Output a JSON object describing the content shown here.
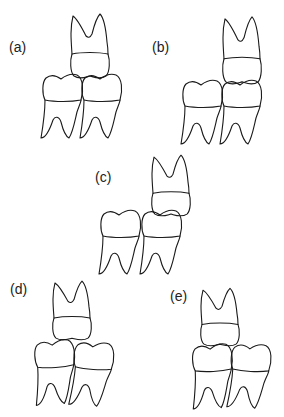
{
  "figure": {
    "panels": [
      {
        "id": "a",
        "label": "(a)"
      },
      {
        "id": "b",
        "label": "(b)"
      },
      {
        "id": "c",
        "label": "(c)"
      },
      {
        "id": "d",
        "label": "(d)"
      },
      {
        "id": "e",
        "label": "(e)"
      }
    ]
  },
  "colors": {
    "line": "#1a1a1a",
    "background": "#ffffff"
  }
}
